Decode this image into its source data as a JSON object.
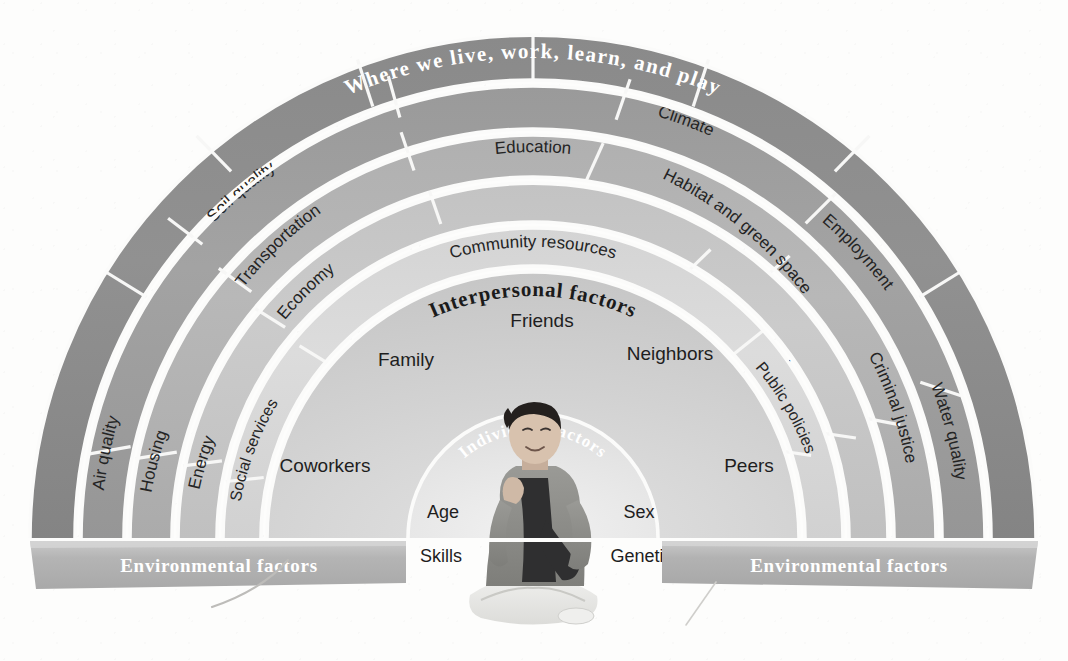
{
  "diagram": {
    "type": "socio-ecological-model",
    "center": {
      "x": 533,
      "y": 538
    },
    "outer_title": "Where we live, work, learn, and play",
    "interpersonal_title": "Interpersonal factors",
    "individual_title": "Individual factors",
    "environmental_label_left": "Environmental factors",
    "environmental_label_right": "Environmental factors",
    "colors": {
      "ring_outer": "#8d8d8d",
      "ring_2": "#9d9d9d",
      "ring_3": "#b3b3b3",
      "ring_4": "#c6c6c6",
      "ring_5": "#d6d6d6",
      "interpersonal": "#cfcfcf",
      "individual": "#e6e6e6",
      "divider": "#f7f7f6",
      "env_bar": "#b5b5b5",
      "text_dark": "#1e1e1e",
      "text_light": "#ffffff",
      "page_bg": "#fdfdfc"
    },
    "rings": [
      {
        "name": "outer-ring",
        "r_outer": 503,
        "r_inner": 458,
        "fill": "#8d8d8d",
        "title_on_ring": "Where we live, work, learn, and play",
        "segments": [
          {
            "label": "",
            "a0": 180,
            "a1": 148
          },
          {
            "label": "",
            "a0": 148,
            "a1": 118
          },
          {
            "label": "",
            "a0": 118,
            "a1": 92
          },
          {
            "label": "",
            "a0": 92,
            "a1": 62
          },
          {
            "label": "",
            "a0": 62,
            "a1": 32
          },
          {
            "label": "",
            "a0": 32,
            "a1": 0
          }
        ]
      },
      {
        "name": "ring-2",
        "r_outer": 452,
        "r_inner": 409,
        "fill": "#9d9d9d",
        "segments": [
          {
            "label": "Air quality",
            "a0": 180,
            "a1": 156
          },
          {
            "label": "Soil quality",
            "a0": 156,
            "a1": 118
          },
          {
            "label": "Climate",
            "a0": 118,
            "a1": 84
          },
          {
            "label": "Employment",
            "a0": 84,
            "a1": 48
          },
          {
            "label": "Water quality",
            "a0": 48,
            "a1": 18
          },
          {
            "label": "",
            "a0": 18,
            "a1": 0
          }
        ]
      },
      {
        "name": "ring-3",
        "r_outer": 403,
        "r_inner": 361,
        "fill": "#b3b3b3",
        "segments": [
          {
            "label": "Housing",
            "a0": 180,
            "a1": 157
          },
          {
            "label": "Transportation",
            "a0": 157,
            "a1": 127
          },
          {
            "label": "Education",
            "a0": 127,
            "a1": 79
          },
          {
            "label": "Habitat and green space",
            "a0": 79,
            "a1": 38
          },
          {
            "label": "Criminal justice",
            "a0": 38,
            "a1": 14
          },
          {
            "label": "",
            "a0": 14,
            "a1": 0
          }
        ]
      },
      {
        "name": "ring-4",
        "r_outer": 355,
        "r_inner": 316,
        "fill": "#c6c6c6",
        "segments": [
          {
            "label": "Energy",
            "a0": 180,
            "a1": 158
          },
          {
            "label": "Economy",
            "a0": 158,
            "a1": 125
          },
          {
            "label": "",
            "a0": 125,
            "a1": 60
          },
          {
            "label": "Neighborhood",
            "a0": 60,
            "a1": 26
          },
          {
            "label": "",
            "a0": 26,
            "a1": 0
          }
        ]
      },
      {
        "name": "ring-5",
        "r_outer": 310,
        "r_inner": 272,
        "fill": "#d6d6d6",
        "segments": [
          {
            "label": "Social services",
            "a0": 180,
            "a1": 152
          },
          {
            "label": "Community resources",
            "a0": 152,
            "a1": 42
          },
          {
            "label": "Public policies",
            "a0": 42,
            "a1": 14
          },
          {
            "label": "",
            "a0": 14,
            "a1": 0
          }
        ]
      }
    ],
    "interpersonal": {
      "r_outer": 266,
      "r_inner": 126,
      "fill": "#cfcfcf",
      "title": "Interpersonal factors",
      "labels": [
        {
          "text": "Coworkers",
          "x": 325,
          "y": 472
        },
        {
          "text": "Family",
          "x": 406,
          "y": 366
        },
        {
          "text": "Friends",
          "x": 542,
          "y": 327
        },
        {
          "text": "Neighbors",
          "x": 670,
          "y": 360
        },
        {
          "text": "Peers",
          "x": 749,
          "y": 472
        }
      ]
    },
    "individual": {
      "r": 125,
      "fill": "#e6e6e6",
      "title": "Individual factors",
      "labels": [
        {
          "text": "Age",
          "x": 443,
          "y": 518
        },
        {
          "text": "Sex",
          "x": 639,
          "y": 518
        },
        {
          "text": "Skills",
          "x": 441,
          "y": 562
        },
        {
          "text": "Genetics",
          "x": 646,
          "y": 562
        }
      ],
      "figure": "seated-person-photo"
    },
    "env_bars": [
      {
        "side": "left",
        "label": "Environmental factors"
      },
      {
        "side": "right",
        "label": "Environmental factors"
      }
    ]
  }
}
